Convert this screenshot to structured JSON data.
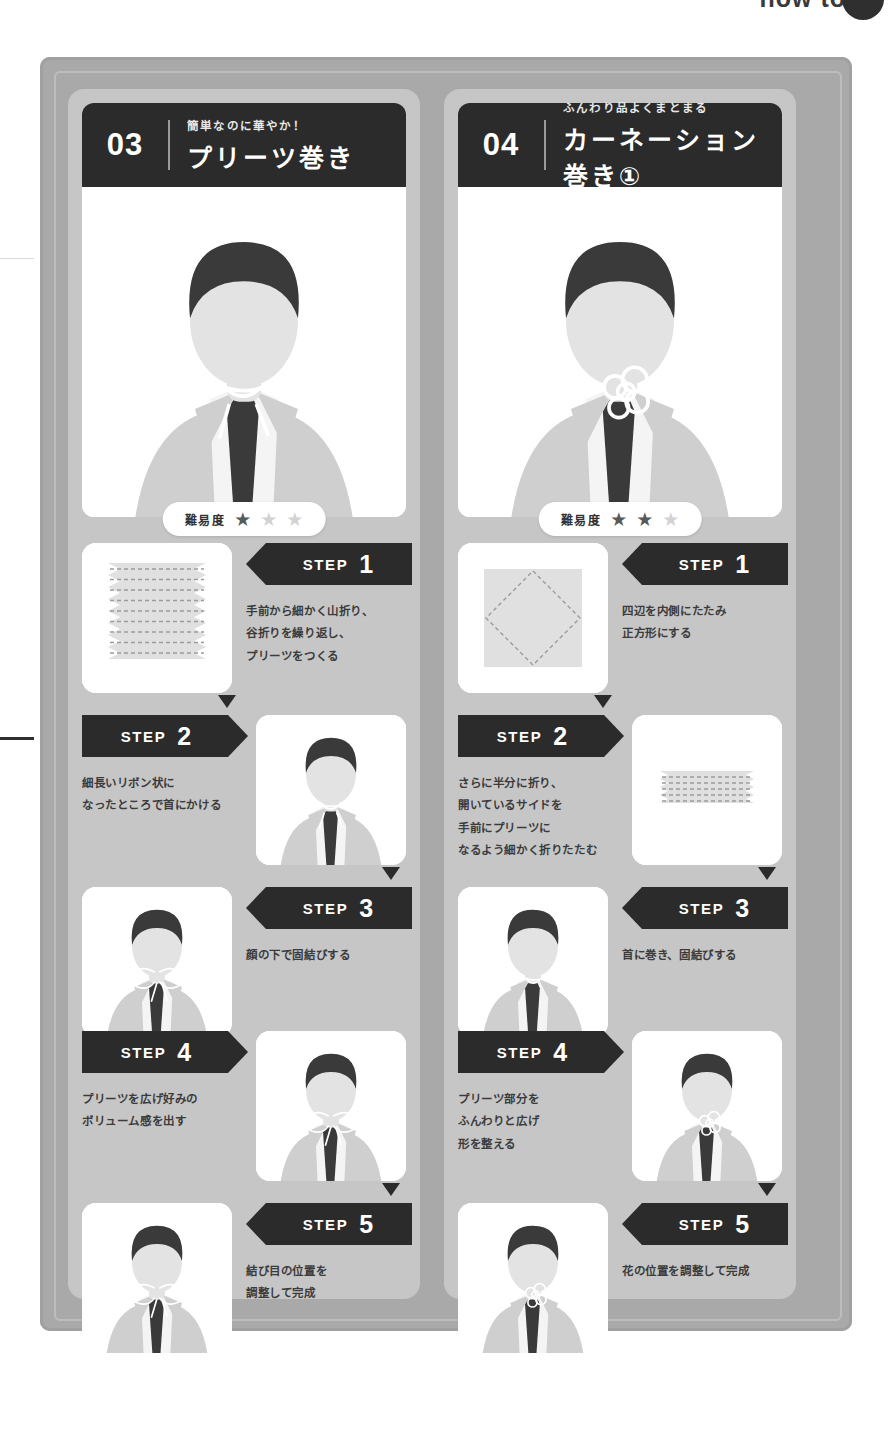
{
  "page": {
    "corner_label": "how to",
    "difficulty_label": "難易度",
    "step_word": "STEP"
  },
  "cards": [
    {
      "number": "03",
      "subtitle": "簡単なのに華やか！",
      "title": "プリーツ巻き",
      "difficulty_filled": 1,
      "difficulty_total": 3,
      "steps": [
        {
          "num": "1",
          "text": "手前から細かく山折り、\n谷折りを繰り返し、\nプリーツをつくる",
          "badge_side": "right",
          "thumb_side": "left"
        },
        {
          "num": "2",
          "text": "細長いリボン状に\nなったところで首にかける",
          "badge_side": "left",
          "thumb_side": "right"
        },
        {
          "num": "3",
          "text": "顔の下で固結びする",
          "badge_side": "right",
          "thumb_side": "left"
        },
        {
          "num": "4",
          "text": "プリーツを広げ好みの\nボリューム感を出す",
          "badge_side": "left",
          "thumb_side": "right"
        },
        {
          "num": "5",
          "text": "結び目の位置を\n調整して完成",
          "badge_side": "right",
          "thumb_side": "left"
        }
      ]
    },
    {
      "number": "04",
      "subtitle": "ふんわり品よくまとまる",
      "title": "カーネーション巻き①",
      "difficulty_filled": 2,
      "difficulty_total": 3,
      "steps": [
        {
          "num": "1",
          "text": "四辺を内側にたたみ\n正方形にする",
          "badge_side": "right",
          "thumb_side": "left"
        },
        {
          "num": "2",
          "text": "さらに半分に折り、\n開いているサイドを\n手前にプリーツに\nなるよう細かく折りたたむ",
          "badge_side": "left",
          "thumb_side": "right"
        },
        {
          "num": "3",
          "text": "首に巻き、固結びする",
          "badge_side": "right",
          "thumb_side": "left"
        },
        {
          "num": "4",
          "text": "プリーツ部分を\nふんわりと広げ\n形を整える",
          "badge_side": "left",
          "thumb_side": "right"
        },
        {
          "num": "5",
          "text": "花の位置を調整して完成",
          "badge_side": "right",
          "thumb_side": "left"
        }
      ]
    }
  ],
  "colors": {
    "panel_bg": "#a9a9a9",
    "column_bg": "#c6c6c6",
    "header_bg": "#2b2b2b",
    "card_white": "#ffffff",
    "text_dark": "#3b3b3b",
    "star_on": "#595959",
    "star_off": "#d2d2d2"
  }
}
